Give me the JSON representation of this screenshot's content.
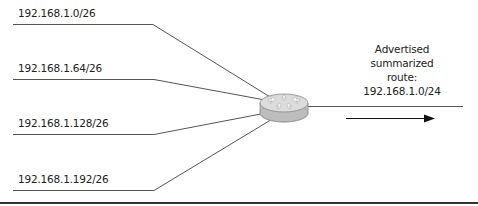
{
  "diagram": {
    "type": "route-summarization",
    "subnets": [
      {
        "label": "192.168.1.0/26"
      },
      {
        "label": "192.168.1.64/26"
      },
      {
        "label": "192.168.1.128/26"
      },
      {
        "label": "192.168.1.192/26"
      }
    ],
    "router": {
      "icon": "router-icon"
    },
    "advertisement": {
      "lines": [
        "Advertised",
        "summarized",
        "route:",
        "192.168.1.0/24"
      ]
    },
    "arrow": {
      "direction": "right"
    },
    "colors": {
      "line": "#555555",
      "text": "#222222",
      "router_top": "#d8d8d8",
      "router_side": "#bdbdbd",
      "arrow": "#111111",
      "rule": "#333333"
    }
  }
}
